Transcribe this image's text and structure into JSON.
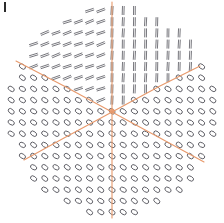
{
  "figure": {
    "title": "",
    "domain_shape": "circle",
    "center_x": 112,
    "center_y": 111,
    "radius": 104,
    "background_color": "#ffffff",
    "glyph_color": "#4a4a52",
    "separatrix_color": "#e8996b",
    "separatrix_width": 1.1,
    "corner_tick": {
      "label": "",
      "color": "#2b2b2b",
      "x": 4,
      "y": 2,
      "width": 2,
      "height": 10
    }
  },
  "chart_data": {
    "type": "scatter",
    "subtitle": "",
    "xlabel": "",
    "ylabel": "",
    "xlim": [
      -1,
      1
    ],
    "ylim": [
      -1,
      1
    ],
    "grid": false,
    "legend": null,
    "annotations": [
      "degenerate point at center",
      "linear (dash) glyphs in upper region",
      "elliptical (oval) glyphs in lower region"
    ],
    "glyph_grid": {
      "spacing_px": 11.2,
      "rows": 19,
      "cols": 19,
      "origin_x": 11.2,
      "origin_y": 10.5,
      "description": "Regular square lattice clipped to a circular domain; each node carries one tensor glyph."
    },
    "glyph_types": [
      {
        "name": "dash",
        "region": "upper-left quadrant",
        "description": "short nearly-horizontal double-stroke segments, slight upward tilt",
        "angle_deg": 20,
        "length_px": 9,
        "count_approx": 70
      },
      {
        "name": "bar",
        "region": "upper-right quadrant",
        "description": "short vertical double-stroke segments",
        "angle_deg": 88,
        "length_px": 9,
        "count_approx": 60
      },
      {
        "name": "ellipse",
        "region": "lower half and outer left/right bands",
        "description": "small open ovals, major axis tilted ~55 degrees",
        "rx_px": 2.2,
        "ry_px": 3.4,
        "angle_deg": 55,
        "count_approx": 190
      }
    ],
    "separatrices": [
      {
        "name": "vertical-axis",
        "points": [
          [
            112,
            2
          ],
          [
            112,
            112
          ],
          [
            112,
            218
          ]
        ],
        "color": "#e8996b"
      },
      {
        "name": "upper-left-branch",
        "points": [
          [
            16,
            61
          ],
          [
            64,
            86
          ],
          [
            112,
            112
          ]
        ],
        "color": "#e8996b"
      },
      {
        "name": "upper-right-branch",
        "points": [
          [
            112,
            112
          ],
          [
            160,
            86
          ],
          [
            200,
            66
          ]
        ],
        "color": "#e8996b"
      },
      {
        "name": "lower-left-branch",
        "points": [
          [
            112,
            112
          ],
          [
            64,
            138
          ],
          [
            24,
            160
          ]
        ],
        "color": "#e8996b"
      },
      {
        "name": "lower-right-branch",
        "points": [
          [
            112,
            112
          ],
          [
            160,
            138
          ],
          [
            204,
            162
          ]
        ],
        "color": "#e8996b"
      }
    ]
  }
}
